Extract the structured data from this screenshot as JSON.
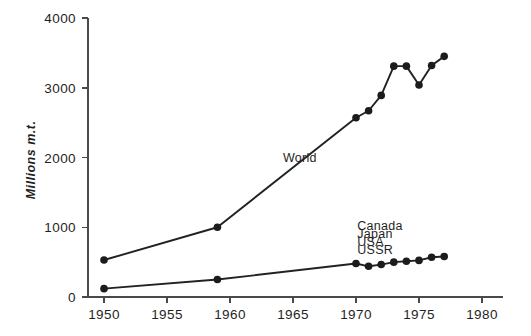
{
  "chart_data": {
    "type": "line",
    "title": "",
    "xlabel": "",
    "ylabel": "Millions m.t.",
    "xlim": [
      1948,
      1981
    ],
    "ylim": [
      0,
      4000
    ],
    "xticks": [
      1950,
      1955,
      1960,
      1965,
      1970,
      1975,
      1980
    ],
    "xticklabels": [
      "1950",
      "1955",
      "1960",
      "1965",
      "1970",
      "1975",
      "1980"
    ],
    "yticks": [
      0,
      1000,
      2000,
      3000,
      4000
    ],
    "yticklabels": [
      "0",
      "1000",
      "2000",
      "3000",
      "4000"
    ],
    "grid": false,
    "legend_position": "inline-annotation",
    "series": [
      {
        "name": "World",
        "label": "World",
        "label_x": 1964.2,
        "label_y": 1930,
        "color": "#222222",
        "x": [
          1950,
          1959,
          1970,
          1971,
          1972,
          1973,
          1974,
          1975,
          1976,
          1977
        ],
        "values": [
          530,
          1000,
          2570,
          2670,
          2890,
          3310,
          3310,
          3040,
          3320,
          3450
        ]
      },
      {
        "name": "Canada Japan USA USSR",
        "label": "",
        "color": "#222222",
        "x": [
          1950,
          1959,
          1970,
          1971,
          1972,
          1973,
          1974,
          1975,
          1976,
          1977
        ],
        "values": [
          120,
          250,
          480,
          440,
          465,
          500,
          512,
          525,
          570,
          580
        ]
      }
    ],
    "annotations": [
      {
        "text": "Canada",
        "x": 1970.1,
        "y": 960
      },
      {
        "text": "Japan",
        "x": 1970.1,
        "y": 845
      },
      {
        "text": "USA",
        "x": 1970.1,
        "y": 730
      },
      {
        "text": "USSR",
        "x": 1970.1,
        "y": 615
      }
    ]
  },
  "axes": {
    "y_title": "Millions m.t.",
    "y_tick_0": "0",
    "y_tick_1": "1000",
    "y_tick_2": "2000",
    "y_tick_3": "3000",
    "y_tick_4": "4000",
    "x_tick_0": "1950",
    "x_tick_1": "1955",
    "x_tick_2": "1960",
    "x_tick_3": "1965",
    "x_tick_4": "1970",
    "x_tick_5": "1975",
    "x_tick_6": "1980"
  },
  "labels": {
    "world": "World",
    "canada": "Canada",
    "japan": "Japan",
    "usa": "USA",
    "ussr": "USSR"
  },
  "colors": {
    "axis": "#4a4a4a",
    "line": "#222222",
    "marker": "#1c1c1c",
    "text": "#1f1f1f",
    "background": "#ffffff"
  }
}
